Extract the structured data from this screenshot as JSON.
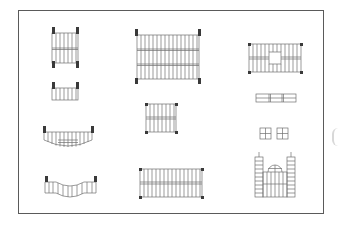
{
  "diagram": {
    "frame": {
      "stroke": "#5a5a5a"
    },
    "line_color": "#707070",
    "post_color": "#3a3a3a",
    "elements": [
      {
        "id": "stair-a",
        "label": "Straight stair plan, two flights with posts",
        "x": 52,
        "y": 26,
        "w": 24,
        "h": 38
      },
      {
        "id": "stair-b",
        "label": "Wide straight stair plan, three flights",
        "x": 134,
        "y": 29,
        "w": 66,
        "h": 52
      },
      {
        "id": "stair-c",
        "label": "Stair plan with central landing opening",
        "x": 248,
        "y": 42,
        "w": 54,
        "h": 30
      },
      {
        "id": "stair-d",
        "label": "Short single-flight stair with top posts",
        "x": 52,
        "y": 81,
        "w": 24,
        "h": 20
      },
      {
        "id": "stair-e",
        "label": "Medium stair plan, two flights",
        "x": 144,
        "y": 102,
        "w": 32,
        "h": 30
      },
      {
        "id": "panel-strip",
        "label": "Horizontal panel strip",
        "x": 256,
        "y": 94,
        "w": 40,
        "h": 8
      },
      {
        "id": "stair-f",
        "label": "Curved (concave) stair plan",
        "x": 43,
        "y": 126,
        "w": 50,
        "h": 22
      },
      {
        "id": "window-pair",
        "label": "Pair of four-pane windows",
        "x": 260,
        "y": 128,
        "w": 30,
        "h": 12
      },
      {
        "id": "stair-g",
        "label": "Wavy stair plan",
        "x": 45,
        "y": 176,
        "w": 52,
        "h": 20
      },
      {
        "id": "stair-h",
        "label": "Long stair plan, two flights",
        "x": 138,
        "y": 168,
        "w": 66,
        "h": 30
      },
      {
        "id": "tower-facade",
        "label": "Facade with twin towers and dome",
        "x": 253,
        "y": 153,
        "w": 44,
        "h": 45
      }
    ]
  }
}
